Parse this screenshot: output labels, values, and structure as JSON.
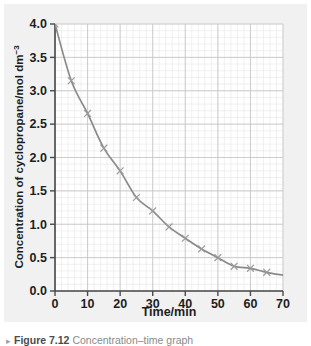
{
  "figure": {
    "background_color": "#f1f1f1",
    "panel_color": "#ffffff",
    "caption_marker": "▸",
    "caption_label": "Figure 7.12",
    "caption_text": "Concentration–time graph"
  },
  "chart_data": {
    "type": "line",
    "title": "",
    "subtitle": "",
    "xlabel": "Time/min",
    "ylabel": "Concentration of cyclopropane/mol dm",
    "ylabel_superscript": "−3",
    "xlim": [
      0,
      70
    ],
    "ylim": [
      0,
      4.0
    ],
    "xticks": [
      0,
      10,
      20,
      30,
      40,
      50,
      60,
      70
    ],
    "xtick_labels": [
      "0",
      "10",
      "20",
      "30",
      "40",
      "50",
      "60",
      "70"
    ],
    "yticks": [
      0.0,
      0.5,
      1.0,
      1.5,
      2.0,
      2.5,
      3.0,
      3.5,
      4.0
    ],
    "ytick_labels": [
      "0.0",
      "0.5",
      "1.0",
      "1.5",
      "2.0",
      "2.5",
      "3.0",
      "3.5",
      "4.0"
    ],
    "grid": true,
    "grid_minor_step_x": 2,
    "grid_minor_step_y": 0.1,
    "grid_major_step_x": 10,
    "grid_major_step_y": 0.5,
    "legend": null,
    "legend_position": "none",
    "marker": "x",
    "line_color": "#8a8a8a",
    "marker_color": "#9a9a9a",
    "grid_minor_color": "#e6e6e6",
    "grid_major_color": "#c8c8c8",
    "axis_color": "#4a4a4a",
    "x": [
      0,
      5,
      10,
      15,
      20,
      25,
      30,
      35,
      40,
      45,
      50,
      55,
      60,
      65
    ],
    "y": [
      4.0,
      3.15,
      2.66,
      2.14,
      1.8,
      1.4,
      1.2,
      0.96,
      0.79,
      0.63,
      0.5,
      0.37,
      0.34,
      0.28
    ],
    "series": [
      {
        "name": "Concentration of cyclopropane",
        "values": [
          4.0,
          3.15,
          2.66,
          2.14,
          1.8,
          1.4,
          1.2,
          0.96,
          0.79,
          0.63,
          0.5,
          0.37,
          0.34,
          0.28
        ]
      }
    ]
  }
}
